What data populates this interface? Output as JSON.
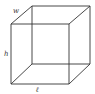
{
  "diagram": {
    "type": "rectangular-prism",
    "stroke_color": "#333333",
    "background": "#ffffff",
    "labels": {
      "width": "w",
      "height": "h",
      "length": "ℓ"
    },
    "vertices": {
      "front_top_left": [
        11,
        24
      ],
      "front_top_right": [
        69,
        24
      ],
      "front_bottom_left": [
        11,
        84
      ],
      "front_bottom_right": [
        69,
        84
      ],
      "back_top_left": [
        32,
        6
      ],
      "back_top_right": [
        90,
        6
      ],
      "back_bottom_left": [
        32,
        64
      ],
      "back_bottom_right": [
        90,
        64
      ]
    }
  }
}
